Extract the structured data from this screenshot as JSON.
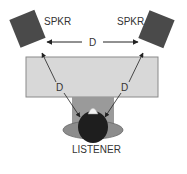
{
  "diagram": {
    "labels": {
      "speaker_left": "SPKR",
      "speaker_right": "SPKR",
      "distance_top": "D",
      "distance_left": "D",
      "distance_right": "D",
      "listener": "LISTENER"
    },
    "colors": {
      "speaker": "#4a4a4a",
      "screen_fill": "#d8d8d8",
      "screen_border": "#8a8a8a",
      "arrow": "#222222",
      "head": "#1e1e1e",
      "chair": "#8c8c8c"
    }
  }
}
